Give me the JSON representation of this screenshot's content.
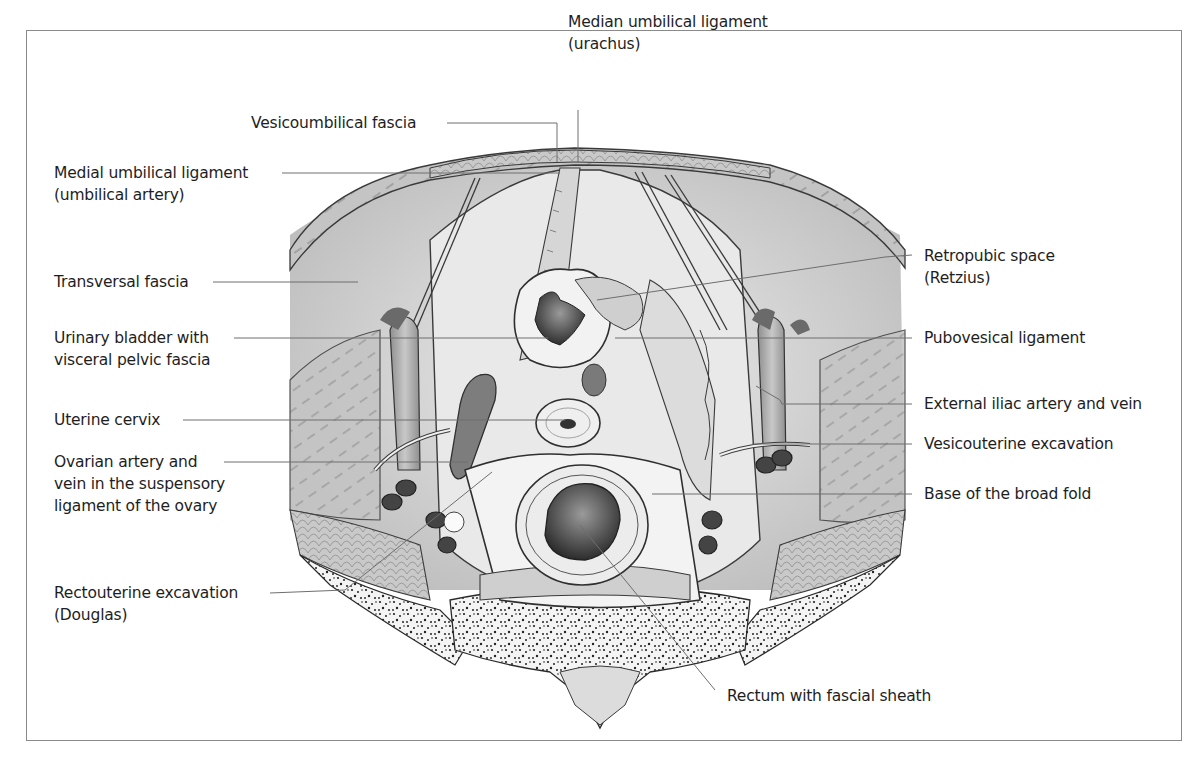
{
  "figure": {
    "colors": {
      "frame": "#8a8a8a",
      "leader": "#6e6e6e",
      "text": "#1e1e1e",
      "tissue_light": "#e4e4e4",
      "tissue_mid": "#bdbdbd",
      "tissue_dark": "#5a5a5a",
      "bone": "#f4f4f4",
      "bone_speckle": "#222222"
    }
  },
  "labels": {
    "median_umbilical": {
      "line1": "Median umbilical ligament",
      "line2": "(urachus)"
    },
    "vesicoumbilical": {
      "line1": "Vesicoumbilical fascia"
    },
    "medial_umbilical": {
      "line1": "Medial umbilical ligament",
      "line2": "(umbilical artery)"
    },
    "transversal_fascia": {
      "line1": "Transversal fascia"
    },
    "urinary_bladder": {
      "line1": "Urinary bladder with",
      "line2": "visceral pelvic fascia"
    },
    "uterine_cervix": {
      "line1": "Uterine cervix"
    },
    "ovarian_artery": {
      "line1": "Ovarian artery and",
      "line2": "vein in the suspensory",
      "line3": "ligament of the ovary"
    },
    "rectouterine": {
      "line1": "Rectouterine excavation",
      "line2": "(Douglas)"
    },
    "retropubic": {
      "line1": "Retropubic space",
      "line2": "(Retzius)"
    },
    "pubovesical": {
      "line1": "Pubovesical ligament"
    },
    "external_iliac": {
      "line1": "External iliac artery and vein"
    },
    "vesicouterine": {
      "line1": "Vesicouterine excavation"
    },
    "broad_fold": {
      "line1": "Base of the broad fold"
    },
    "rectum": {
      "line1": "Rectum with fascial sheath"
    }
  }
}
